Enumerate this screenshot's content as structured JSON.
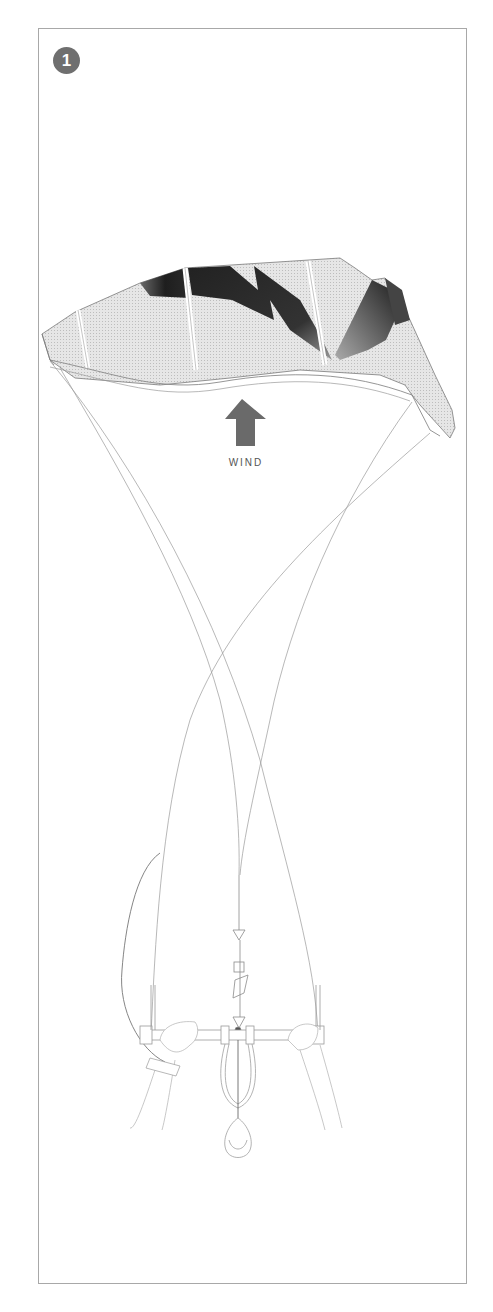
{
  "figure": {
    "step_number": "1",
    "wind_label": "WIND",
    "elements": [
      "kite-canopy",
      "leading-edge",
      "struts",
      "wind-arrow",
      "flying-lines",
      "control-bar",
      "hands",
      "chicken-loop",
      "safety-leash"
    ]
  },
  "colors": {
    "frame": "#a8a8a8",
    "badge": "#6f6f6f",
    "canopy_light": "#d8d8d8",
    "canopy_dark": "#2a2a2a",
    "arrow": "#6a6a6a",
    "lines": "#9a9a9a"
  }
}
